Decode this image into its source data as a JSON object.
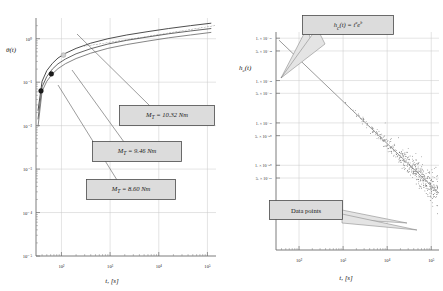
{
  "figure": {
    "panels": [
      "left",
      "right"
    ]
  },
  "chart_data": [
    {
      "type": "line",
      "id": "left",
      "title": "",
      "xlabel": "t, [s]",
      "ylabel": "θ(t)",
      "xscale": "log",
      "yscale": "log",
      "xlim": [
        30,
        150000
      ],
      "ylim": [
        1e-05,
        3
      ],
      "xticks": [
        "10²",
        "10³",
        "10⁴",
        "10⁵"
      ],
      "xtick_values": [
        100,
        1000,
        10000,
        100000
      ],
      "yticks": [
        "10⁰",
        "10⁻¹",
        "10⁻²",
        "10⁻³",
        "10⁻⁴",
        "10⁻⁵"
      ],
      "ytick_values": [
        1,
        0.1,
        0.01,
        0.001,
        0.0001,
        1e-05
      ],
      "grid": true,
      "legend": "none",
      "series": [
        {
          "name": "M_T = 10.32 Nm",
          "label": "M_T = 10.32 Nm",
          "marker_point": [
            110,
            0.42
          ],
          "x": [
            33,
            40,
            50,
            65,
            85,
            120,
            200,
            400,
            900,
            2200,
            6000,
            16000,
            45000,
            120000
          ],
          "y": [
            0.022,
            0.105,
            0.185,
            0.27,
            0.36,
            0.46,
            0.6,
            0.79,
            1.0,
            1.22,
            1.46,
            1.72,
            2.0,
            2.28
          ]
        },
        {
          "name": "M_T = 9.46 Nm",
          "label": "M_T = 9.46 Nm",
          "marker_point": [
            62,
            0.155
          ],
          "x": [
            33,
            40,
            50,
            65,
            85,
            120,
            200,
            400,
            900,
            2200,
            6000,
            16000,
            45000,
            120000
          ],
          "y": [
            0.014,
            0.078,
            0.135,
            0.2,
            0.265,
            0.34,
            0.45,
            0.59,
            0.755,
            0.92,
            1.1,
            1.3,
            1.51,
            1.72
          ]
        },
        {
          "name": "M_T = 8.60 Nm",
          "label": "M_T = 8.60 Nm",
          "marker_point": [
            38,
            0.063
          ],
          "x": [
            33,
            40,
            50,
            65,
            85,
            120,
            200,
            400,
            900,
            2200,
            6000,
            16000,
            45000,
            120000
          ],
          "y": [
            0.0095,
            0.062,
            0.105,
            0.155,
            0.205,
            0.265,
            0.35,
            0.465,
            0.6,
            0.735,
            0.885,
            1.05,
            1.22,
            1.4
          ]
        }
      ],
      "annotations": [
        {
          "text": "M_T = 10.32 Nm",
          "sym": "M",
          "sub": "T",
          "rest": " = 10.32 Nm"
        },
        {
          "text": "M_T = 9.46 Nm",
          "sym": "M",
          "sub": "T",
          "rest": " = 9.46 Nm"
        },
        {
          "text": "M_T = 8.60 Nm",
          "sym": "M",
          "sub": "T",
          "rest": " = 8.60 Nm"
        }
      ]
    },
    {
      "type": "scatter",
      "id": "right",
      "title": "",
      "xlabel": "t, [s]",
      "ylabel": "h_c(t)",
      "xscale": "log",
      "yscale": "log",
      "xlim": [
        30,
        150000
      ],
      "ylim": [
        1e-52,
        1.4e-47
      ],
      "xticks": [
        "10²",
        "10³",
        "10⁴",
        "10⁵"
      ],
      "xtick_values": [
        100,
        1000,
        10000,
        100000
      ],
      "yticks": [
        "1. × 10⁻⁴⁷",
        "5. × 10⁻⁴⁸",
        "1. × 10⁻⁴⁸",
        "5. × 10⁻⁴⁹",
        "1. × 10⁻⁴⁹",
        "5. × 10⁻⁵⁰",
        "1. × 10⁻⁵⁰",
        "5. × 10⁻⁵¹"
      ],
      "ytick_values": [
        1e-47,
        5e-48,
        1e-48,
        5e-49,
        1e-49,
        5e-50,
        1e-50,
        5e-51
      ],
      "grid": true,
      "legend": "none",
      "fit_label": "h_c(t) = t^a e^b",
      "scatter_label": "Data points",
      "fit_line": {
        "x": [
          35,
          150000
        ],
        "y": [
          9e-48,
          2.2e-51
        ]
      },
      "scatter_note": "dense cloud of points scattered about the fitted power law, spreading wider at large t"
    }
  ],
  "callouts": {
    "left": [
      {
        "name": "torque-10-32",
        "m": "M",
        "sub": "T",
        "rest": " = 10.32 Nm"
      },
      {
        "name": "torque-9-46",
        "m": "M",
        "sub": "T",
        "rest": " = 9.46 Nm"
      },
      {
        "name": "torque-8-60",
        "m": "M",
        "sub": "T",
        "rest": " = 8.60 Nm"
      }
    ],
    "right": [
      {
        "name": "fit-equation",
        "text": "h"
      },
      {
        "name": "data-points",
        "text": "Data points"
      }
    ]
  },
  "labels": {
    "left_y": "θ(t)",
    "left_x": "t, [s]",
    "right_y_h": "h",
    "right_y_sub": "c",
    "right_y_rest": "(t)",
    "right_x": "t, [s]",
    "fit_h": "h",
    "fit_sub": "c",
    "fit_mid": "(t) = t",
    "fit_a": "a",
    "fit_e": "e",
    "fit_b": "b",
    "data_points": "Data points"
  }
}
